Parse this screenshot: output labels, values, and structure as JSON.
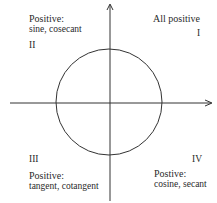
{
  "quadrants": {
    "I": {
      "numeral": "I",
      "heading": "All positive",
      "functions": ""
    },
    "II": {
      "numeral": "II",
      "heading": "Positive:",
      "functions": "sine, cosecant"
    },
    "III": {
      "numeral": "III",
      "heading": "Positive:",
      "functions": "tangent, cotangent"
    },
    "IV": {
      "numeral": "IV",
      "heading": "Postive:",
      "functions": "cosine, secant"
    }
  },
  "geometry": {
    "axis_color": "#333333",
    "circle_center": [
      109,
      102
    ],
    "circle_radius": 53
  }
}
